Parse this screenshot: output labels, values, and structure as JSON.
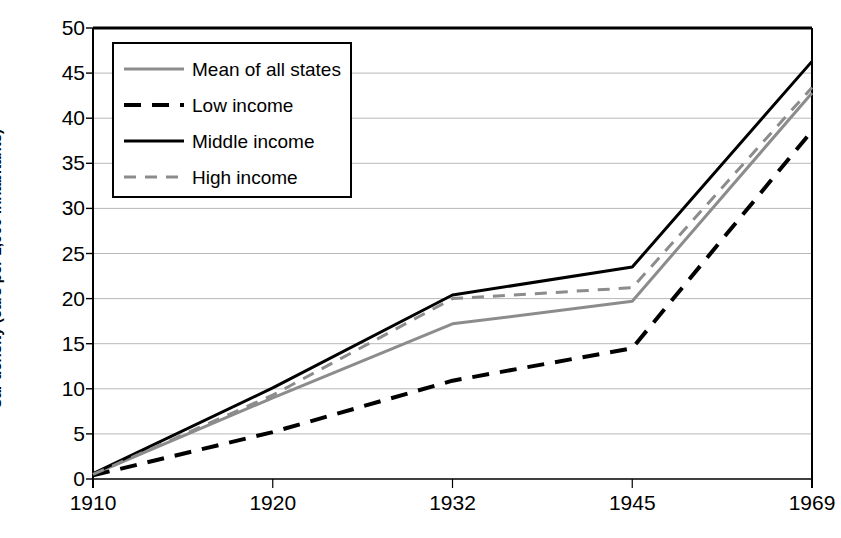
{
  "chart_data": {
    "type": "line",
    "title": "",
    "xlabel": "",
    "ylabel": "Car density (cars per 1,000 inhabitants)",
    "categories": [
      "1910",
      "1920",
      "1932",
      "1945",
      "1969"
    ],
    "ylim": [
      0,
      50
    ],
    "ytick_step": 5,
    "yticks": [
      "50",
      "45",
      "40",
      "35",
      "30",
      "25",
      "20",
      "15",
      "10",
      "5",
      "0"
    ],
    "grid": "horizontal",
    "legend_position": "top-left-inside",
    "series": [
      {
        "name": "Mean of all states",
        "values": [
          0.5,
          9.0,
          17.2,
          19.7,
          42.8
        ],
        "color": "#8c8c8c",
        "style": "solid",
        "width": 3
      },
      {
        "name": "Low income",
        "values": [
          0.4,
          5.2,
          10.9,
          14.5,
          38.6
        ],
        "color": "#000000",
        "style": "dashed",
        "width": 4
      },
      {
        "name": "Middle income",
        "values": [
          0.6,
          10.1,
          20.4,
          23.5,
          46.3
        ],
        "color": "#000000",
        "style": "solid",
        "width": 3
      },
      {
        "name": "High income",
        "values": [
          0.5,
          9.3,
          20.0,
          21.2,
          43.4
        ],
        "color": "#8c8c8c",
        "style": "dashed",
        "width": 3
      }
    ]
  },
  "axes": {
    "frame_color": "#000000",
    "grid_color": "#b8b8b8"
  }
}
